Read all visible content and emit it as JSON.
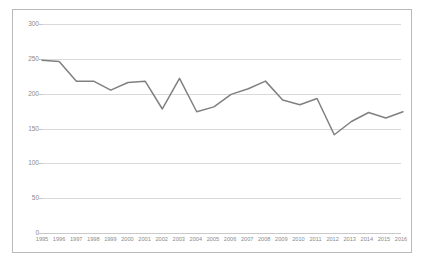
{
  "chart_data": {
    "type": "line",
    "title": "",
    "subtitle": "",
    "xlabel": "",
    "ylabel": "",
    "legend": [],
    "legend_position": "none",
    "grid": true,
    "grid_axis": "y",
    "xlim": [
      1995,
      2016
    ],
    "ylim": [
      0,
      300
    ],
    "y_ticks": [
      0,
      50,
      100,
      150,
      200,
      250,
      300
    ],
    "y_tick_labels": [
      "0",
      "50",
      "100",
      "150",
      "200",
      "250",
      "300"
    ],
    "x": [
      1995,
      1996,
      1997,
      1998,
      1999,
      2000,
      2001,
      2002,
      2003,
      2004,
      2005,
      2006,
      2007,
      2008,
      2009,
      2010,
      2011,
      2012,
      2013,
      2014,
      2015,
      2016
    ],
    "categories": [
      "1995",
      "1996",
      "1997",
      "1998",
      "1999",
      "2000",
      "2001",
      "2002",
      "2003",
      "2004",
      "2005",
      "2006",
      "2007",
      "2008",
      "2009",
      "2010",
      "2011",
      "2012",
      "2013",
      "2014",
      "2015",
      "2016"
    ],
    "values": [
      248,
      246,
      218,
      218,
      205,
      216,
      218,
      178,
      222,
      174,
      181,
      199,
      207,
      218,
      191,
      184,
      193,
      141,
      160,
      173,
      165,
      174
    ],
    "series": [
      {
        "name": "",
        "color": "#808080",
        "values": [
          248,
          246,
          218,
          218,
          205,
          216,
          218,
          178,
          222,
          174,
          181,
          199,
          207,
          218,
          191,
          184,
          193,
          141,
          160,
          173,
          165,
          174
        ]
      }
    ],
    "markers": false,
    "line_width": 1.5
  },
  "colors": {
    "line": "#808080",
    "gridline": "#d9d9d9",
    "axis": "#c9c9c9",
    "tick_text": "#8a8a8a",
    "frame_border": "#b9b9b9",
    "background": "#ffffff"
  }
}
